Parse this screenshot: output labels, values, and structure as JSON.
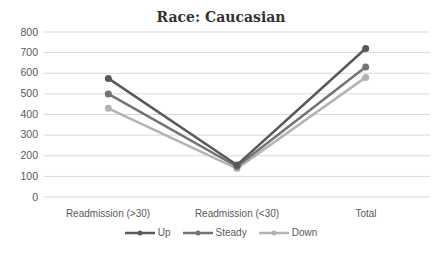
{
  "chart_data": {
    "type": "line",
    "title": "Race: Caucasian",
    "xlabel": "",
    "ylabel": "",
    "categories": [
      "Readmission (>30)",
      "Readmission (<30)",
      "Total"
    ],
    "series": [
      {
        "name": "Up",
        "values": [
          575,
          155,
          720
        ],
        "color": "#595959"
      },
      {
        "name": "Steady",
        "values": [
          500,
          148,
          630
        ],
        "color": "#737373"
      },
      {
        "name": "Down",
        "values": [
          430,
          138,
          580
        ],
        "color": "#b3b3b3"
      }
    ],
    "ylim": [
      0,
      800
    ],
    "yticks": [
      "0",
      "100",
      "200",
      "300",
      "400",
      "500",
      "600",
      "700",
      "800"
    ],
    "grid": true,
    "legend_position": "bottom"
  }
}
